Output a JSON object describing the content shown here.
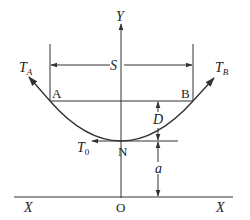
{
  "figure": {
    "type": "catenary-cable-diagram",
    "colors": {
      "line": "#333333",
      "text": "#222222",
      "background": "#ffffff"
    }
  },
  "axes": {
    "y_label": "Y",
    "x_left_label": "X",
    "x_right_label": "X",
    "origin_label": "O"
  },
  "points": {
    "A": "A",
    "B": "B",
    "N": "N"
  },
  "forces": {
    "TA": {
      "main": "T",
      "sub": "A"
    },
    "TB": {
      "main": "T",
      "sub": "B"
    },
    "T0": {
      "main": "T",
      "sub": "0"
    }
  },
  "dimensions": {
    "span": "S",
    "sag": "D",
    "height": "a"
  }
}
